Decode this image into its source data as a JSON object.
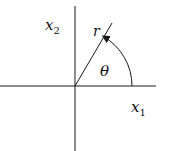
{
  "diagram": {
    "type": "polar-coordinate-figure",
    "colors": {
      "stroke": "#1a1a1a",
      "background": "#ffffff"
    },
    "origin": {
      "x": 75,
      "y": 86
    },
    "axes": {
      "horizontal": {
        "x1": 0,
        "x2": 156,
        "y": 86,
        "label": "x",
        "subscript": "1"
      },
      "vertical": {
        "x": 75,
        "y1": 6,
        "y2": 151,
        "label": "x",
        "subscript": "2"
      }
    },
    "ray": {
      "label": "r",
      "end": {
        "x": 112,
        "y": 23
      }
    },
    "angle": {
      "label": "θ",
      "radius": 57,
      "direction": "counterclockwise"
    }
  }
}
